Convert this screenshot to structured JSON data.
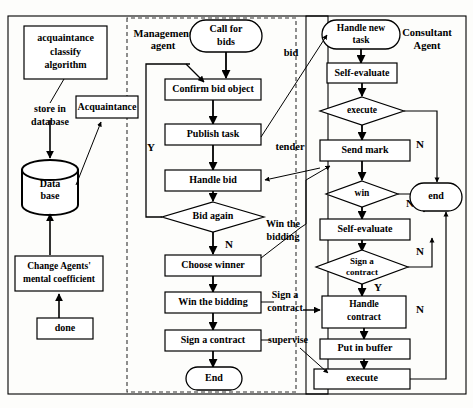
{
  "diagram": {
    "containers": [
      {
        "id": "management",
        "label": "Management\nagent",
        "label_line1": "Management",
        "label_line2": "agent"
      },
      {
        "id": "consultant",
        "label": "Consultant\nAgent",
        "label_line1": "Consultant",
        "label_line2": "Agent"
      }
    ],
    "left_column": {
      "acquaintance_algorithm_line1": "acquaintance",
      "acquaintance_algorithm_line2": "classify",
      "acquaintance_algorithm_line3": "algorithm",
      "store_in_database_line1": "store in",
      "store_in_database_line2": "database",
      "acquaintance": "Acquaintance",
      "database_line1": "Data",
      "database_line2": "base",
      "change_agents_line1": "Change Agents'",
      "change_agents_line2": "mental coefficient",
      "done": "done"
    },
    "management_column": {
      "call_for_bids_line1": "Call for",
      "call_for_bids_line2": "bids",
      "confirm_bid_object": "Confirm bid object",
      "publish_task": "Publish task",
      "handle_bid": "Handle bid",
      "bid_again": "Bid again",
      "bid_again_yes": "Y",
      "bid_again_no": "N",
      "choose_winner": "Choose winner",
      "win_the_bidding": "Win the bidding",
      "sign_a_contract": "Sign a contract",
      "end": "End"
    },
    "consultant_column": {
      "handle_new_task_line1": "Handle new",
      "handle_new_task_line2": "task",
      "self_evaluate_1": "Self-evaluate",
      "execute_decision": "execute",
      "execute_no": "N",
      "send_mark": "Send mark",
      "win_decision": "win",
      "win_no": "N",
      "self_evaluate_2": "Self-evaluate",
      "sign_contract_decision_line1": "Sign a",
      "sign_contract_decision_line2": "contract",
      "sign_contract_no": "N",
      "sign_contract_yes": "Y",
      "handle_contract_line1": "Handle",
      "handle_contract_line2": "contract",
      "put_in_buffer": "Put in buffer",
      "execute_box": "execute",
      "execute_box_no": "N",
      "end": "end"
    },
    "interagent_labels": {
      "bid": "bid",
      "tender": "tender",
      "win_the_bidding_line1": "Win the",
      "win_the_bidding_line2": "bidding",
      "sign_a_contract_line1": "Sign a",
      "sign_a_contract_line2": "contract",
      "supervise": "supervise"
    },
    "colors": {
      "stroke": "#000000",
      "fill": "#ffffff",
      "background": "#fdfdfb",
      "dashed": "#444444"
    }
  }
}
